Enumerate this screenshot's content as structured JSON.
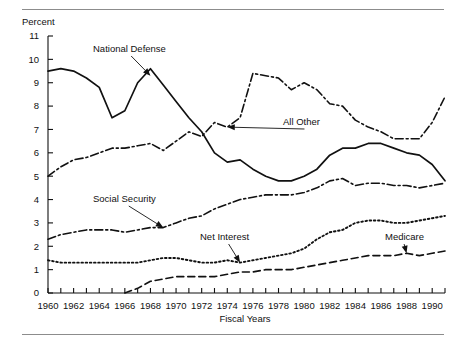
{
  "figure": {
    "y_axis_caption": "Percent",
    "x_axis_title": "Fiscal Years"
  },
  "chart_data": {
    "type": "line",
    "title": "",
    "subtitle": "",
    "xlabel": "Fiscal Years",
    "ylabel": "Percent",
    "xlim": [
      1960,
      1991
    ],
    "ylim": [
      0,
      11
    ],
    "grid": false,
    "legend": "inline-annotations",
    "ytick_labels": [
      "0",
      "1",
      "2",
      "3",
      "4",
      "5",
      "6",
      "7",
      "8",
      "9",
      "10",
      "11"
    ],
    "ytick_values": [
      0,
      1,
      2,
      3,
      4,
      5,
      6,
      7,
      8,
      9,
      10,
      11
    ],
    "xtick_labels": [
      "1960",
      "1962",
      "1964",
      "1966",
      "1968",
      "1970",
      "1972",
      "1974",
      "1976",
      "1978",
      "1980",
      "1982",
      "1984",
      "1986",
      "1988",
      "1990"
    ],
    "xtick_values": [
      1960,
      1962,
      1964,
      1966,
      1968,
      1970,
      1972,
      1974,
      1976,
      1978,
      1980,
      1982,
      1984,
      1986,
      1988,
      1990
    ],
    "x": [
      1960,
      1961,
      1962,
      1963,
      1964,
      1965,
      1966,
      1967,
      1968,
      1969,
      1970,
      1971,
      1972,
      1973,
      1974,
      1975,
      1976,
      1977,
      1978,
      1979,
      1980,
      1981,
      1982,
      1983,
      1984,
      1985,
      1986,
      1987,
      1988,
      1989,
      1990,
      1991
    ],
    "series": [
      {
        "name": "National Defense",
        "dash": "solid",
        "annotation": {
          "label": "National Defense",
          "point_year": 1968,
          "point_value": 9.3
        },
        "values": [
          9.5,
          9.6,
          9.5,
          9.2,
          8.8,
          7.5,
          7.8,
          9.0,
          9.6,
          8.9,
          8.2,
          7.5,
          6.9,
          6.0,
          5.6,
          5.7,
          5.3,
          5.0,
          4.8,
          4.8,
          5.0,
          5.3,
          5.9,
          6.2,
          6.2,
          6.4,
          6.4,
          6.2,
          6.0,
          5.9,
          5.5,
          4.8
        ]
      },
      {
        "name": "All Other",
        "dash": "dash-dot",
        "annotation": {
          "label": "All Other",
          "point_year": 1974,
          "point_value": 7.1
        },
        "values": [
          5.0,
          5.4,
          5.7,
          5.8,
          6.0,
          6.2,
          6.2,
          6.3,
          6.4,
          6.1,
          6.5,
          6.9,
          6.7,
          7.3,
          7.1,
          7.5,
          9.4,
          9.3,
          9.2,
          8.7,
          9.0,
          8.7,
          8.1,
          8.0,
          7.4,
          7.1,
          6.9,
          6.6,
          6.6,
          6.6,
          7.3,
          8.4
        ]
      },
      {
        "name": "Social Security",
        "dash": "dash-dot",
        "annotation": {
          "label": "Social Security",
          "point_year": 1969,
          "point_value": 2.8
        },
        "values": [
          2.3,
          2.5,
          2.6,
          2.7,
          2.7,
          2.7,
          2.6,
          2.7,
          2.8,
          2.8,
          3.0,
          3.2,
          3.3,
          3.6,
          3.8,
          4.0,
          4.1,
          4.2,
          4.2,
          4.2,
          4.3,
          4.5,
          4.8,
          4.9,
          4.6,
          4.7,
          4.7,
          4.6,
          4.6,
          4.5,
          4.6,
          4.7
        ]
      },
      {
        "name": "Net Interest",
        "dash": "dotted",
        "annotation": {
          "label": "Net Interest",
          "point_year": 1975,
          "point_value": 1.3
        },
        "values": [
          1.4,
          1.3,
          1.3,
          1.3,
          1.3,
          1.3,
          1.3,
          1.3,
          1.4,
          1.5,
          1.5,
          1.4,
          1.3,
          1.3,
          1.4,
          1.3,
          1.4,
          1.5,
          1.6,
          1.7,
          1.9,
          2.3,
          2.6,
          2.7,
          3.0,
          3.1,
          3.1,
          3.0,
          3.0,
          3.1,
          3.2,
          3.3
        ]
      },
      {
        "name": "Medicare",
        "dash": "dashed",
        "annotation": {
          "label": "Medicare",
          "point_year": 1988,
          "point_value": 1.7
        },
        "values": [
          0.0,
          0.0,
          0.0,
          0.0,
          0.0,
          0.0,
          0.0,
          0.2,
          0.5,
          0.6,
          0.7,
          0.7,
          0.7,
          0.7,
          0.8,
          0.9,
          0.9,
          1.0,
          1.0,
          1.0,
          1.1,
          1.2,
          1.3,
          1.4,
          1.5,
          1.6,
          1.6,
          1.6,
          1.7,
          1.6,
          1.7,
          1.8
        ]
      }
    ]
  }
}
